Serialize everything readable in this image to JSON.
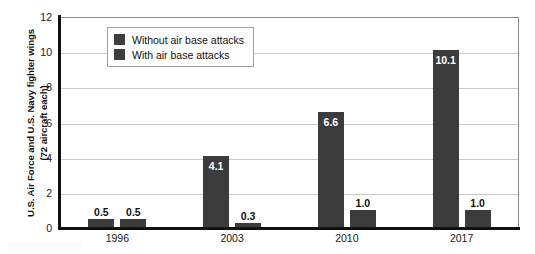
{
  "chart_data": {
    "type": "bar",
    "title": "",
    "subtitle": "",
    "xlabel": "",
    "ylabel": "U.S. Air Force and U.S. Navy fighter wings (72 aircraft each)",
    "ylabel_lines": [
      "U.S. Air Force and U.S. Navy fighter wings",
      "(72 aircraft each)"
    ],
    "categories": [
      "1996",
      "2003",
      "2010",
      "2017"
    ],
    "series": [
      {
        "name": "Without air base attacks",
        "color": "#3c3c3c",
        "values": [
          0.5,
          4.1,
          6.6,
          10.1
        ],
        "labels": [
          "0.5",
          "4.1",
          "6.6",
          "10.1"
        ]
      },
      {
        "name": "With air base attacks",
        "color": "#3c3c3c",
        "values": [
          0.5,
          0.3,
          1.0,
          1.0
        ],
        "labels": [
          "0.5",
          "0.3",
          "1.0",
          "1.0"
        ]
      }
    ],
    "ylim": [
      0,
      12
    ],
    "yticks": [
      0,
      2,
      4,
      6,
      8,
      10,
      12
    ],
    "ytick_labels": [
      "0",
      "2",
      "4",
      "6",
      "8",
      "10",
      "12"
    ],
    "grid": "horizontal",
    "legend_position": "upper-left-inside",
    "legend_entries": [
      "Without air base attacks",
      "With air base attacks"
    ],
    "axis_color": "#111111",
    "gridline_color": "#c9c9c9",
    "background": "#ffffff"
  }
}
